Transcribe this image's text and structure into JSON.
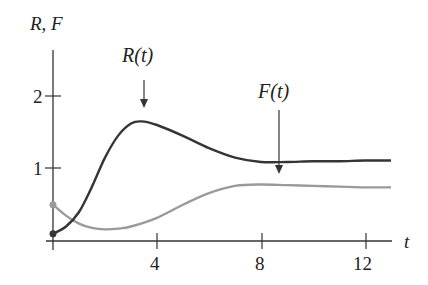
{
  "chart_data": {
    "type": "line",
    "title": "",
    "xlabel": "t",
    "ylabel": "R, F",
    "x_ticks": [
      "4",
      "8",
      "12"
    ],
    "y_ticks": [
      "1",
      "2"
    ],
    "xlim": [
      0,
      13
    ],
    "ylim": [
      0,
      2.5
    ],
    "grid": false,
    "legend": "none",
    "annotations": [
      {
        "text": "R(t)",
        "arrow_to": [
          3.4,
          1.7
        ]
      },
      {
        "text": "F(t)",
        "arrow_to": [
          8.6,
          1.08
        ]
      }
    ],
    "series": [
      {
        "name": "R(t)",
        "color": "#333333",
        "x": [
          0,
          0.5,
          1,
          1.5,
          2,
          2.5,
          3,
          3.4,
          4,
          5,
          6,
          7,
          8,
          9,
          10,
          11,
          12,
          13
        ],
        "values": [
          0.1,
          0.2,
          0.4,
          0.75,
          1.15,
          1.45,
          1.62,
          1.65,
          1.6,
          1.45,
          1.28,
          1.15,
          1.09,
          1.09,
          1.1,
          1.1,
          1.11,
          1.11
        ]
      },
      {
        "name": "F(t)",
        "color": "#999999",
        "x": [
          0,
          0.5,
          1,
          1.5,
          2,
          2.5,
          3,
          4,
          5,
          6,
          7,
          8,
          9,
          10,
          11,
          12,
          13
        ],
        "values": [
          0.5,
          0.35,
          0.24,
          0.18,
          0.16,
          0.17,
          0.2,
          0.32,
          0.5,
          0.66,
          0.76,
          0.78,
          0.77,
          0.76,
          0.75,
          0.74,
          0.74
        ]
      }
    ]
  }
}
